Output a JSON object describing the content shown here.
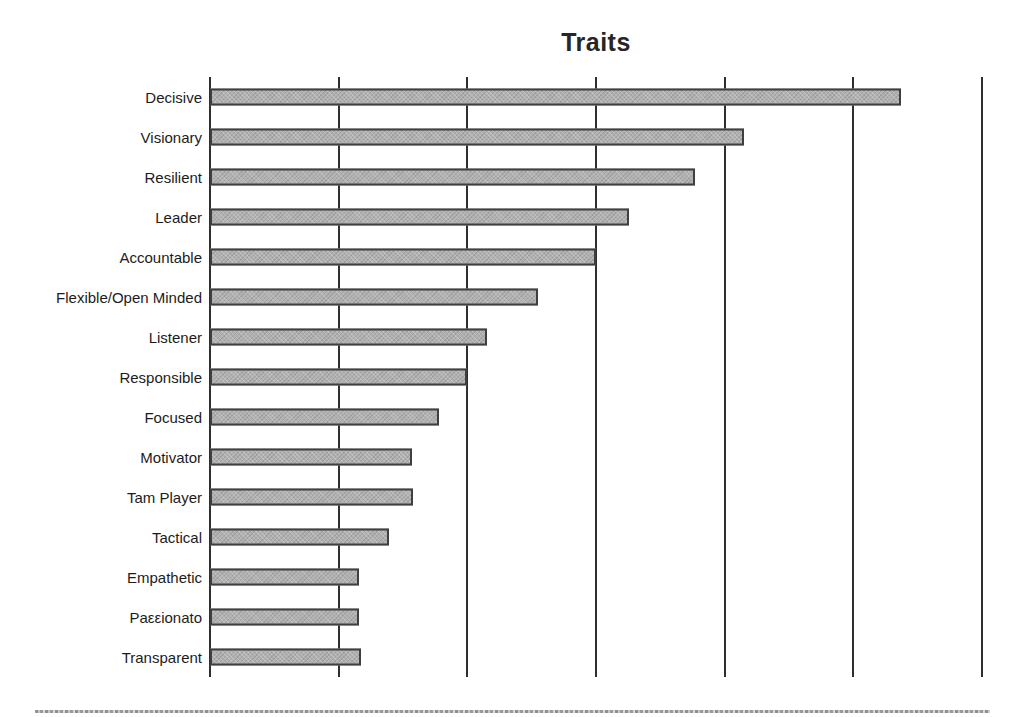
{
  "chart_data": {
    "type": "bar",
    "orientation": "horizontal",
    "title": "Traits",
    "categories": [
      "Decisive",
      "Visionary",
      "Resilient",
      "Leader",
      "Accountable",
      "Flexible/Open Minded",
      "Listener",
      "Responsible",
      "Focused",
      "Motivator",
      "Tam Player",
      "Tactical",
      "Empathetic",
      "Paεεionato",
      "Transparent"
    ],
    "values": [
      5.37,
      4.15,
      3.77,
      3.26,
      3.0,
      2.55,
      2.15,
      2.0,
      1.78,
      1.57,
      1.58,
      1.39,
      1.16,
      1.16,
      1.17
    ],
    "xlabel": "",
    "ylabel": "",
    "xlim": [
      0,
      6
    ],
    "gridline_step": 1,
    "x_tick_labels_visible": false,
    "grid": "vertical-only",
    "legend": "none",
    "colors": {
      "bar_fill": "#B0B0B0",
      "bar_border": "#3F3F3F",
      "gridline": "#2F2F2F",
      "title_text": "#262626",
      "label_text": "#1C1C1C",
      "background": "#FFFFFF",
      "bottom_rule": "#8F8F8F"
    }
  }
}
